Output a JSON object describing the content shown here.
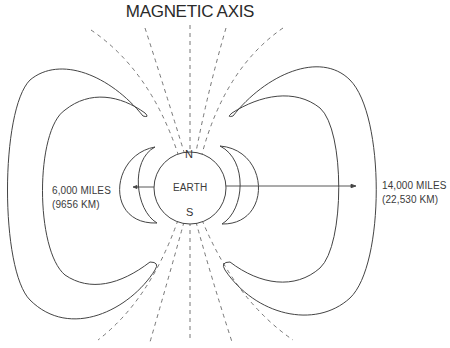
{
  "diagram": {
    "title": "MAGNETIC AXIS",
    "earth": {
      "label": "EARTH",
      "north_label": "N",
      "south_label": "S"
    },
    "inner_belt": {
      "distance_miles": "6,000 MILES",
      "distance_km": "(9656 KM)"
    },
    "outer_belt": {
      "distance_miles": "14,000 MILES",
      "distance_km": "(22,530 KM)"
    },
    "colors": {
      "line": "#444444",
      "dashed": "#666666",
      "text": "#333333",
      "background": "#ffffff"
    }
  }
}
